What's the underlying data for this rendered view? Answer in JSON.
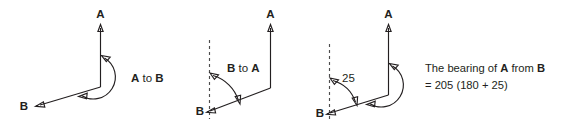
{
  "figure": {
    "background_color": "#ffffff",
    "line_color": "#231f20",
    "dashed_line_color": "#4d4d4d",
    "panels": [
      {
        "id": "panel-1",
        "label_a": "A",
        "label_b": "B",
        "arc_label_parts": [
          "A",
          " to ",
          "B"
        ],
        "arc_label_text": "A to B",
        "has_dashed_north_line": false,
        "angle_value": null
      },
      {
        "id": "panel-2",
        "label_a": "A",
        "label_b": "B",
        "arc_label_parts": [
          "B",
          " to ",
          "A"
        ],
        "arc_label_text": "B to A",
        "has_dashed_north_line": true,
        "angle_value": null
      },
      {
        "id": "panel-3",
        "label_a": "A",
        "label_b": "B",
        "arc_label_parts": null,
        "arc_label_text": null,
        "has_dashed_north_line": true,
        "angle_value": "25"
      }
    ],
    "note": {
      "line1_parts": [
        "The bearing of ",
        "A",
        " from ",
        "B"
      ],
      "line1_text": "The bearing of A from B",
      "line2_text": "= 205 (180 + 25)"
    }
  }
}
